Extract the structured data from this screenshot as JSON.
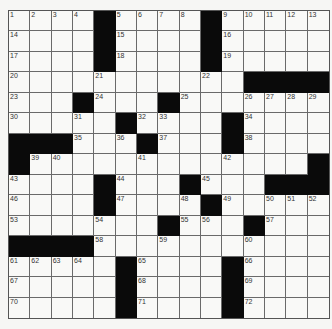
{
  "puzzle": {
    "rows": [
      "1 2 3 4 # 5 6 7 8 # 9 10 11 12 13",
      "14 . . . # 15 . . . # 16 . . . .",
      "17 . . . # 18 . . . # 19 . . . .",
      "20 . . . 21 . . . . 22 . # # # #",
      "23 . . # 24 . . # 25 . . 26 27 28 29",
      "30 . . 31 . # 32 33 . . # 34 . . .",
      "# # # 35 . 36 # 37 . . # 38 . . .",
      "# 39 40 . . . 41 . . . 42 . . . #",
      "43 . . . # 44 . . # 45 . . # # #",
      "46 . . . # 47 . . 48 # 49 . 50 51 52",
      "53 . . . 54 . . # 55 56 . # 57 . .",
      "# # # # 58 . . 59 . . . 60 . . .",
      "61 62 63 64 . # 65 . . . # 66 . . .",
      "67 . . . . # 68 . . . # 69 . . .",
      "70 . . . . # 71 . . . # 72 . . ."
    ]
  }
}
